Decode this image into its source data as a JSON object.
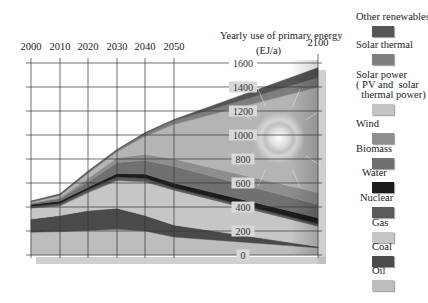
{
  "chart_data": {
    "type": "area",
    "stacked": true,
    "title": "Yearly use of primary energy",
    "ylabel": "(EJ/a)",
    "xlabel": "",
    "x": [
      2000,
      2010,
      2020,
      2030,
      2040,
      2050,
      2100
    ],
    "x_tick_labels": [
      "2000",
      "2010",
      "2020",
      "2030",
      "2040",
      "2050",
      "2100"
    ],
    "y_tick_labels": [
      "0",
      "200",
      "400",
      "600",
      "800",
      "1000",
      "1200",
      "1400",
      "1600"
    ],
    "ylim": [
      0,
      1600
    ],
    "grid": true,
    "legend_position": "right",
    "series": [
      {
        "name": "Oil",
        "color": "#bdbdbd",
        "values": [
          190,
          195,
          205,
          215,
          200,
          150,
          60
        ]
      },
      {
        "name": "Coal",
        "color": "#4a4a4a",
        "values": [
          110,
          135,
          165,
          175,
          130,
          100,
          10
        ]
      },
      {
        "name": "Gas",
        "color": "#c6c6c6",
        "values": [
          90,
          80,
          150,
          230,
          280,
          290,
          170
        ]
      },
      {
        "name": "Nuclear",
        "color": "#5a5a5a",
        "values": [
          15,
          20,
          25,
          30,
          30,
          20,
          20
        ]
      },
      {
        "name": "Water",
        "color": "#1c1c1c",
        "values": [
          15,
          20,
          20,
          30,
          35,
          40,
          50
        ]
      },
      {
        "name": "Biomass",
        "color": "#707070",
        "values": [
          10,
          20,
          45,
          90,
          115,
          140,
          110
        ]
      },
      {
        "name": "Wind",
        "color": "#8e8e8e",
        "values": [
          5,
          10,
          30,
          40,
          50,
          60,
          100
        ]
      },
      {
        "name": "Solar power (PV and solar thermal power)",
        "color": "#b4b4b4",
        "values": [
          5,
          15,
          40,
          50,
          150,
          290,
          880
        ]
      },
      {
        "name": "Solar thermal",
        "color": "#7e7e7e",
        "values": [
          5,
          5,
          10,
          10,
          20,
          30,
          80
        ]
      },
      {
        "name": "Other renewables",
        "color": "#555555",
        "values": [
          5,
          10,
          10,
          10,
          10,
          10,
          80
        ]
      }
    ]
  },
  "labels": {
    "title": "Yearly use of primary energy",
    "unit": "(EJ/a)"
  },
  "legend": [
    {
      "label": "Other renewables",
      "color": "#555555"
    },
    {
      "label": "Solar thermal",
      "color": "#7e7e7e"
    },
    {
      "label": "Solar power\n( PV and  solar\n  thermal power)",
      "color": "#c4c4c4"
    },
    {
      "label": "Wind",
      "color": "#8e8e8e"
    },
    {
      "label": "Biomass",
      "color": "#707070"
    },
    {
      "label": "Water",
      "color": "#1c1c1c"
    },
    {
      "label": "Nuclear",
      "color": "#5a5a5a"
    },
    {
      "label": "Gas",
      "color": "#c6c6c6"
    },
    {
      "label": "Coal",
      "color": "#4a4a4a"
    },
    {
      "label": "Oil",
      "color": "#bdbdbd"
    }
  ]
}
